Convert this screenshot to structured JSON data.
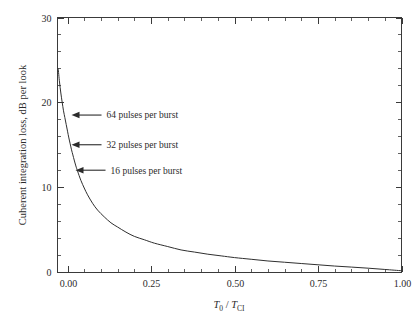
{
  "chart_data": {
    "type": "line",
    "title": "",
    "subtitle": "",
    "xlabel": "T0 / TCI",
    "xlabel_parts": {
      "numerator": "T",
      "numerator_sub": "0",
      "separator": " / ",
      "denominator": "T",
      "denominator_sub": "CI"
    },
    "ylabel": "Cuherent integration loss, dB per look",
    "xlim": [
      -0.03,
      1.0
    ],
    "ylim": [
      0,
      30
    ],
    "x_major_ticks": [
      0.0,
      0.25,
      0.5,
      0.75,
      1.0
    ],
    "x_tick_labels": [
      "0.00",
      "0.25",
      "0.50",
      "0.75",
      "1.00"
    ],
    "x_minor_step": 0.05,
    "y_major_ticks": [
      0,
      10,
      20,
      30
    ],
    "y_tick_labels": [
      "0",
      "10",
      "20",
      "30"
    ],
    "y_minor_step": 2,
    "grid": false,
    "legend": "none",
    "frame": "box",
    "tick_direction": "in",
    "series": [
      {
        "name": "coherent integration loss",
        "color": "#2f2f2f",
        "x": [
          -0.028,
          -0.024,
          -0.02,
          -0.016,
          -0.012,
          -0.008,
          -0.004,
          0.0,
          0.004,
          0.008,
          0.012,
          0.016,
          0.02,
          0.025,
          0.03,
          0.04,
          0.05,
          0.06,
          0.075,
          0.09,
          0.11,
          0.13,
          0.15,
          0.175,
          0.2,
          0.23,
          0.26,
          0.3,
          0.34,
          0.38,
          0.42,
          0.46,
          0.5,
          0.55,
          0.6,
          0.65,
          0.7,
          0.75,
          0.8,
          0.85,
          0.9,
          0.95,
          1.0
        ],
        "y": [
          24.0,
          22.4,
          21.1,
          20.0,
          19.0,
          18.2,
          17.4,
          16.6,
          15.8,
          15.1,
          14.4,
          13.8,
          13.2,
          12.5,
          11.9,
          10.8,
          9.9,
          9.1,
          8.1,
          7.3,
          6.5,
          5.8,
          5.3,
          4.7,
          4.2,
          3.8,
          3.4,
          3.0,
          2.6,
          2.35,
          2.1,
          1.9,
          1.7,
          1.5,
          1.3,
          1.15,
          1.0,
          0.85,
          0.7,
          0.58,
          0.45,
          0.3,
          0.15
        ]
      }
    ],
    "annotations": [
      {
        "id": "n64",
        "label": "64 pulses per burst",
        "pulses": 64,
        "point_x": 0.0,
        "point_y": 18.5
      },
      {
        "id": "n32",
        "label": "32 pulses per burst",
        "pulses": 32,
        "point_x": 0.0,
        "point_y": 15.0
      },
      {
        "id": "n16",
        "label": "16 pulses per burst",
        "pulses": 16,
        "point_x": 0.012,
        "point_y": 12.0
      }
    ],
    "colors": {
      "axis": "#3a3a3a",
      "curve": "#2f2f2f",
      "text": "#2b2b2b",
      "background": "#ffffff"
    }
  }
}
